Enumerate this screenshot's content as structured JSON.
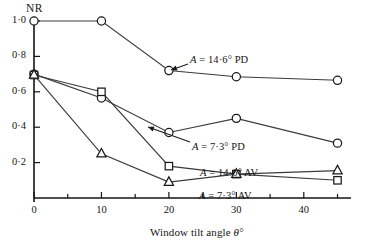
{
  "chart_data": {
    "type": "line",
    "title": "",
    "xlabel": "Window tilt angle θ°",
    "ylabel": "NR",
    "x": [
      0,
      10,
      20,
      30,
      45
    ],
    "xlim": [
      0,
      47
    ],
    "ylim": [
      0,
      1.07
    ],
    "grid": false,
    "legend_position": "inline-annotations",
    "xticks": [
      {
        "value": 0,
        "label": "0",
        "major": true
      },
      {
        "value": 5,
        "label": "",
        "major": false
      },
      {
        "value": 10,
        "label": "10",
        "major": true
      },
      {
        "value": 15,
        "label": "",
        "major": false
      },
      {
        "value": 20,
        "label": "20",
        "major": true
      },
      {
        "value": 25,
        "label": "",
        "major": false
      },
      {
        "value": 30,
        "label": "30",
        "major": true
      },
      {
        "value": 35,
        "label": "",
        "major": false
      },
      {
        "value": 40,
        "label": "40",
        "major": true
      },
      {
        "value": 45,
        "label": "",
        "major": false
      }
    ],
    "yticks": [
      {
        "value": 0.2,
        "label": "0·2"
      },
      {
        "value": 0.4,
        "label": "0·4"
      },
      {
        "value": 0.6,
        "label": "0·6"
      },
      {
        "value": 0.8,
        "label": "0·8"
      },
      {
        "value": 1.0,
        "label": "1·0"
      }
    ],
    "series": [
      {
        "name": "A = 14·6° PD",
        "marker": "circle",
        "values": [
          1.0,
          1.0,
          0.72,
          0.685,
          0.665
        ],
        "label_x": 190,
        "label_y": 54,
        "arrow": {
          "from_x": 188,
          "from_y": 64,
          "to_x": 171,
          "to_y": 70
        }
      },
      {
        "name": "A = 7·3° PD",
        "marker": "circle",
        "values": [
          0.7,
          0.565,
          0.37,
          0.45,
          0.31
        ],
        "label_x": 192,
        "label_y": 141,
        "arrow": {
          "from_x": 190,
          "from_y": 142,
          "to_x": 148,
          "to_y": 127
        }
      },
      {
        "name": "A = 14·6° AV",
        "marker": "square",
        "values": [
          0.695,
          0.6,
          0.18,
          0.135,
          0.1
        ],
        "label_x": 200,
        "label_y": 167,
        "arrow": null
      },
      {
        "name": "A = 7·3° AV",
        "marker": "triangle",
        "values": [
          0.695,
          0.25,
          0.09,
          0.135,
          0.155
        ],
        "label_x": 199,
        "label_y": 190,
        "arrow": null
      }
    ],
    "axis_color": "#141414",
    "line_color": "#3b3b3b",
    "marker_edge_color": "#1a1a1a",
    "marker_face_color": "#ffffff"
  },
  "labels": {
    "y_axis_title": "NR",
    "x_axis_title_main": "Window tilt angle ",
    "x_axis_title_symbol": "θ°"
  }
}
